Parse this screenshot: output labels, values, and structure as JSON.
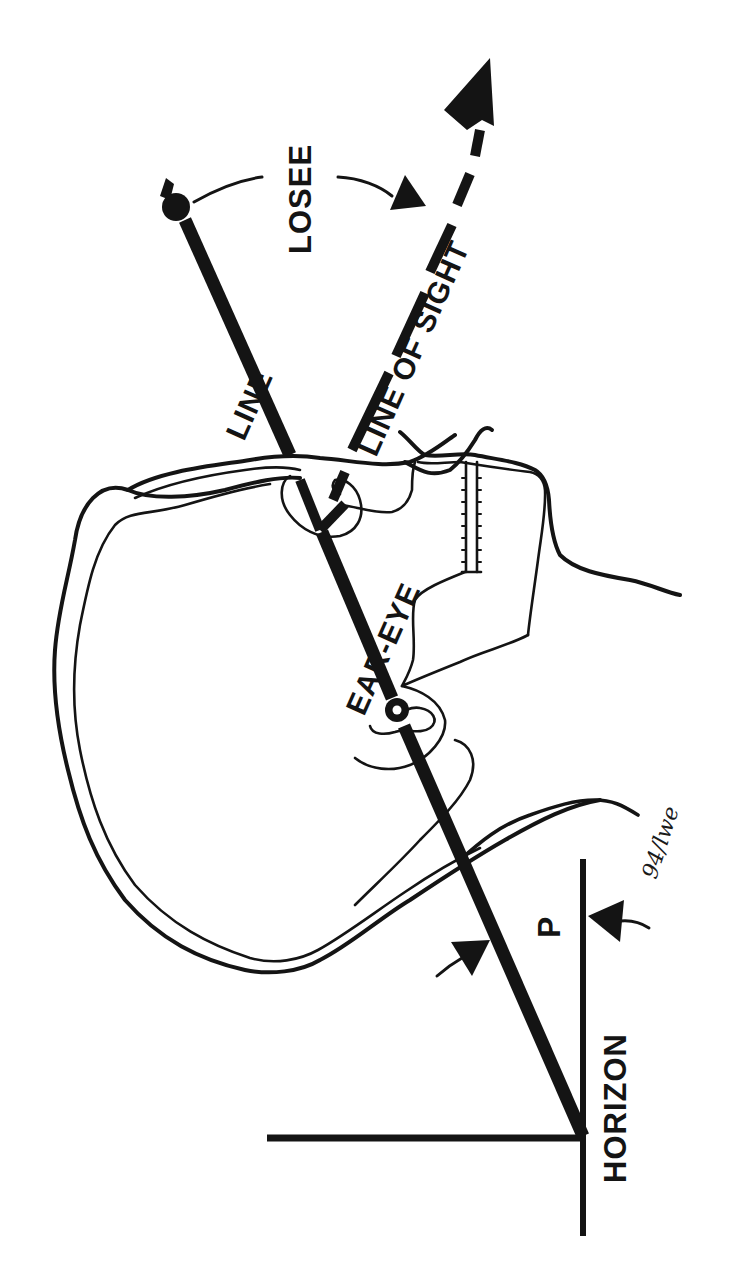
{
  "diagram": {
    "orientation": "rotated 90 degrees counter-clockwise (text reads bottom-to-top)",
    "colors": {
      "ink": "#141414",
      "background": "#ffffff"
    },
    "labels": {
      "losee": "LOSEE",
      "line_upper": "LINE",
      "line_of_sight": "LINE OF SIGHT",
      "ear_eye": "EAR-EYE",
      "p_angle": "P",
      "horizon": "HORIZON"
    },
    "annotation": {
      "handwritten": "94/lwe"
    },
    "elements": [
      {
        "name": "ear-eye-line",
        "type": "thick line",
        "from": "horizon junction",
        "through": [
          "ear dot",
          "eye"
        ],
        "to": "ball terminal",
        "label": "EAR-EYE LINE"
      },
      {
        "name": "line-of-sight",
        "type": "dashed arrow",
        "from": "eye",
        "label": "LINE OF SIGHT"
      },
      {
        "name": "losee-angle",
        "type": "curved arrow annotation",
        "between": [
          "ear-eye line",
          "line of sight"
        ],
        "label": "LOSEE"
      },
      {
        "name": "p-angle",
        "type": "opposing arrows",
        "between": [
          "ear-eye line",
          "horizon"
        ],
        "label": "P"
      },
      {
        "name": "horizon-line",
        "type": "line",
        "label": "HORIZON"
      },
      {
        "name": "vertical-reference",
        "type": "line",
        "perpendicular_to": "horizon"
      },
      {
        "name": "skull-outline",
        "type": "double contour drawing"
      },
      {
        "name": "eye-socket",
        "type": "oval with triangle"
      },
      {
        "name": "ear-canal",
        "type": "small ring dot"
      },
      {
        "name": "teeth",
        "type": "toothed double line"
      },
      {
        "name": "neck-contour",
        "type": "curve"
      }
    ]
  }
}
